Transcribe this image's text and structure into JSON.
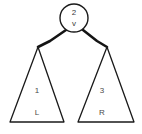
{
  "diagram": {
    "type": "binary-tree",
    "title": "",
    "background_color": "#ffffff",
    "stroke_color": "#1a1a1a",
    "text_color": "#3a3a3a",
    "root_node": {
      "shape": "circle",
      "label_top": "2",
      "label_bottom": "v",
      "center_x": 74,
      "center_y": 18,
      "radius": 14
    },
    "edges": [
      {
        "name": "edge-root-to-left",
        "from": "root",
        "to": "left-subtree"
      },
      {
        "name": "edge-root-to-right",
        "from": "root",
        "to": "right-subtree"
      }
    ],
    "subtrees": [
      {
        "name": "left-subtree",
        "shape": "triangle",
        "label_top": "1",
        "label_bottom": "L",
        "apex_x": 38,
        "apex_y": 47,
        "base_left_x": 10,
        "base_right_x": 64,
        "base_y": 122
      },
      {
        "name": "right-subtree",
        "shape": "triangle",
        "label_top": "3",
        "label_bottom": "R",
        "apex_x": 107,
        "apex_y": 47,
        "base_left_x": 78,
        "base_right_x": 134,
        "base_y": 122
      }
    ]
  }
}
